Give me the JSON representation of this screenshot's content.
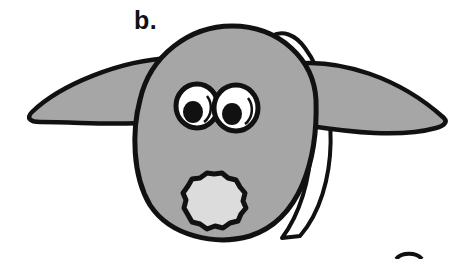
{
  "figure": {
    "label": "b.",
    "colors": {
      "outline": "#111111",
      "head_fill": "#a6a6a6",
      "nose_fill": "#dcdcdc",
      "eye_white": "#ffffff",
      "pupil": "#111111",
      "background": "#ffffff"
    },
    "parts": [
      "head",
      "left-ear",
      "right-ear",
      "left-eye",
      "right-eye",
      "nose-pompom",
      "headband"
    ]
  }
}
